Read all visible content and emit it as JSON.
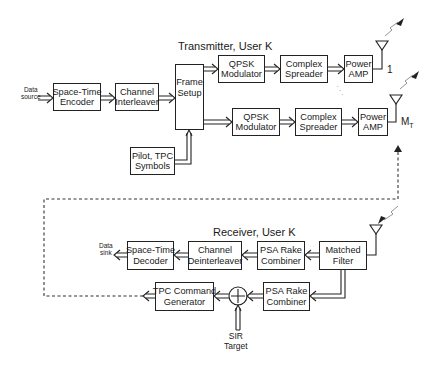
{
  "diagram": {
    "type": "block-diagram",
    "transmitter": {
      "title": "Transmitter, User K",
      "input_label": [
        "Data",
        "source"
      ],
      "blocks": {
        "st_encoder": [
          "Space-Time",
          "Encoder"
        ],
        "ch_interleaver": [
          "Channel",
          "Interleaver"
        ],
        "frame_setup": [
          "Frame",
          "Setup"
        ],
        "pilot_tpc": [
          "Pilot, TPC",
          "Symbols"
        ],
        "qpsk_1": [
          "QPSK",
          "Modulator"
        ],
        "spreader_1": [
          "Complex",
          "Spreader"
        ],
        "amp_1": [
          "Power",
          "AMP"
        ],
        "qpsk_m": [
          "QPSK",
          "Modulator"
        ],
        "spreader_m": [
          "Complex",
          "Spreader"
        ],
        "amp_m": [
          "Power",
          "AMP"
        ]
      },
      "antenna_labels": {
        "first": "1",
        "last_main": "M",
        "last_sub": "T"
      },
      "ellipsis": "· · ·"
    },
    "receiver": {
      "title": "Receiver, User K",
      "output_label": [
        "Data",
        "sink"
      ],
      "blocks": {
        "st_decoder": [
          "Space-Time",
          "Decoder"
        ],
        "ch_deinterleaver": [
          "Channel",
          "Deinterleaver"
        ],
        "psa_rake_1": [
          "PSA Rake",
          "Combiner"
        ],
        "matched_filter": [
          "Matched",
          "Filter"
        ],
        "tpc_cmd": [
          "TPC Command",
          "Generator"
        ],
        "psa_rake_2": [
          "PSA Rake",
          "Combiner"
        ]
      },
      "sum_symbol": "+",
      "sir_label": [
        "SIR",
        "Target"
      ]
    },
    "feedback": {
      "style": "dashed",
      "from": "TPC Command Generator",
      "to": "Power AMP (M_T)"
    },
    "colors": {
      "line": "#222222",
      "background": "#ffffff",
      "dashed": "#333333"
    }
  }
}
